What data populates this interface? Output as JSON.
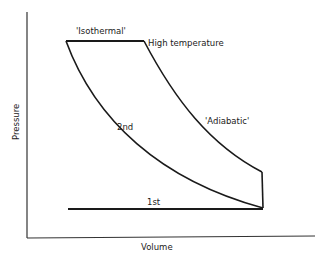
{
  "diagram": {
    "axes": {
      "x_label": "Volume",
      "y_label": "Pressure"
    },
    "labels": {
      "isothermal": "'Isothermal'",
      "high_temperature": "High temperature",
      "adiabatic": "'Adiabatic'",
      "second": "2nd",
      "first": "1st"
    },
    "colors": {
      "line": "#1a1a1a",
      "background": "#ffffff"
    }
  }
}
